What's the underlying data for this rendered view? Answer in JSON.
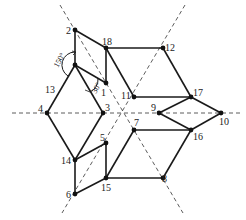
{
  "diagram": {
    "type": "geometric-graph",
    "nodes": [
      {
        "id": "1",
        "x": 106,
        "y": 83,
        "lx": 101,
        "ly": 96
      },
      {
        "id": "2",
        "x": 75,
        "y": 30,
        "lx": 66,
        "ly": 34
      },
      {
        "id": "3",
        "x": 103,
        "y": 113,
        "lx": 105,
        "ly": 111
      },
      {
        "id": "4",
        "x": 47,
        "y": 113,
        "lx": 38,
        "ly": 111
      },
      {
        "id": "5",
        "x": 106,
        "y": 143,
        "lx": 100,
        "ly": 141
      },
      {
        "id": "6",
        "x": 75,
        "y": 194,
        "lx": 66,
        "ly": 198
      },
      {
        "id": "7",
        "x": 134,
        "y": 130,
        "lx": 134,
        "ly": 126
      },
      {
        "id": "8",
        "x": 163,
        "y": 178,
        "lx": 162,
        "ly": 182
      },
      {
        "id": "9",
        "x": 159,
        "y": 113,
        "lx": 151,
        "ly": 111
      },
      {
        "id": "10",
        "x": 221,
        "y": 113,
        "lx": 219,
        "ly": 125
      },
      {
        "id": "11",
        "x": 134,
        "y": 97,
        "lx": 121,
        "ly": 98
      },
      {
        "id": "12",
        "x": 163,
        "y": 48,
        "lx": 165,
        "ly": 51
      },
      {
        "id": "13",
        "x": null,
        "y": null,
        "lx": 45,
        "ly": 92
      },
      {
        "id": "14",
        "x": 75,
        "y": 160,
        "lx": 61,
        "ly": 164
      },
      {
        "id": "15",
        "x": 106,
        "y": 178,
        "lx": 101,
        "ly": 190
      },
      {
        "id": "16",
        "x": 191,
        "y": 130,
        "lx": 193,
        "ly": 140
      },
      {
        "id": "17",
        "x": 191,
        "y": 97,
        "lx": 193,
        "ly": 96
      },
      {
        "id": "18",
        "x": 106,
        "y": 48,
        "lx": 102,
        "ly": 45
      }
    ],
    "center_node": {
      "x": 75,
      "y": 65
    },
    "angle_labels": [
      {
        "text": "150°",
        "x": 53,
        "y": 58,
        "rotate": -60
      },
      {
        "text": "30°",
        "x": 94,
        "y": 88,
        "rotate": -60
      }
    ]
  }
}
